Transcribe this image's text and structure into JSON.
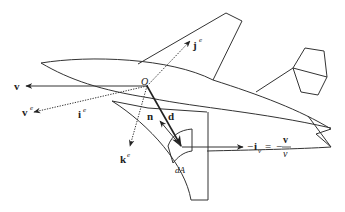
{
  "figure": {
    "origin_label": "O",
    "labels": {
      "v": "v",
      "v_e": "v",
      "v_e_sup": "e",
      "i_e": "i",
      "i_e_sup": "e",
      "j_e": "j",
      "j_e_sup": "e",
      "k_e": "k",
      "k_e_sup": "e",
      "n": "n",
      "d": "d",
      "dA": "dA",
      "iv_lhs_minus": "−",
      "iv_lhs": "i",
      "iv_lhs_sub": "v",
      "equals": "=",
      "rhs_minus": "−",
      "rhs_num": "v",
      "rhs_den": "v"
    },
    "colors": {
      "stroke": "#333333",
      "text": "#222222",
      "background": "#ffffff"
    }
  }
}
